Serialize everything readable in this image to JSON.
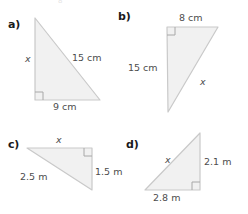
{
  "page": {
    "cutoff_header": "8",
    "fill_color": "#f1f1f1",
    "stroke_color": "#c9c9c9",
    "label_color": "#4d4d4d",
    "part_color": "#1a1a1a"
  },
  "figures": [
    {
      "id": "a",
      "part_label": "a)",
      "right_angle_corner": "bottom-left",
      "labels": {
        "vertical": "x",
        "hypotenuse": "15 cm",
        "base": "9 cm"
      },
      "unknown_side": "vertical",
      "known_sides": [
        {
          "name": "hypotenuse",
          "value": 15,
          "unit": "cm"
        },
        {
          "name": "base",
          "value": 9,
          "unit": "cm"
        }
      ]
    },
    {
      "id": "b",
      "part_label": "b)",
      "right_angle_corner": "top-left",
      "labels": {
        "top": "8 cm",
        "vertical": "15 cm",
        "hypotenuse": "x"
      },
      "unknown_side": "hypotenuse",
      "known_sides": [
        {
          "name": "top",
          "value": 8,
          "unit": "cm"
        },
        {
          "name": "vertical",
          "value": 15,
          "unit": "cm"
        }
      ]
    },
    {
      "id": "c",
      "part_label": "c)",
      "right_angle_corner": "top-right",
      "labels": {
        "top": "x",
        "vertical": "1.5 m",
        "hypotenuse": "2.5 m"
      },
      "unknown_side": "top",
      "known_sides": [
        {
          "name": "vertical",
          "value": 1.5,
          "unit": "m"
        },
        {
          "name": "hypotenuse",
          "value": 2.5,
          "unit": "m"
        }
      ]
    },
    {
      "id": "d",
      "part_label": "d)",
      "right_angle_corner": "bottom-right",
      "labels": {
        "hypotenuse": "x",
        "vertical": "2.1 m",
        "base": "2.8 m"
      },
      "unknown_side": "hypotenuse",
      "known_sides": [
        {
          "name": "vertical",
          "value": 2.1,
          "unit": "m"
        },
        {
          "name": "base",
          "value": 2.8,
          "unit": "m"
        }
      ]
    }
  ]
}
